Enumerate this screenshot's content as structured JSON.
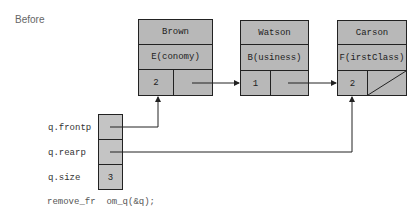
{
  "title": "Before",
  "nodes": [
    {
      "name": "Brown",
      "class": "E(conomy)",
      "count": "2",
      "next": "pointer"
    },
    {
      "name": "Watson",
      "class": "B(usiness)",
      "count": "1",
      "next": "pointer"
    },
    {
      "name": "Carson",
      "class": "F(irstClass)",
      "count": "2",
      "next": "null"
    }
  ],
  "queue": {
    "frontp_label": "q.frontp",
    "rearp_label": "q.rearp",
    "size_label": "q.size",
    "size_value": "3"
  },
  "code": "remove_fr  om_q(&q);",
  "colors": {
    "node_fill": "#b8b8b8",
    "queue_fill": "#c4c4c4",
    "line": "#222222"
  }
}
